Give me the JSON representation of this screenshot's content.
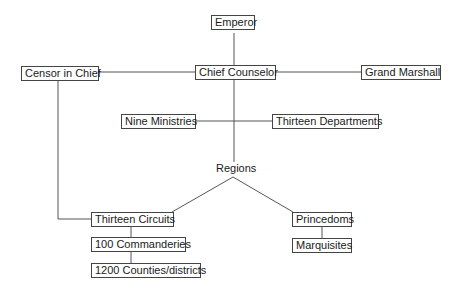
{
  "diagram": {
    "nodes": {
      "emperor": "Emperor",
      "chief_counselor": "Chief Counselor",
      "censor_in_chief": "Censor in Chief",
      "grand_marshall": "Grand Marshall",
      "nine_ministries": "Nine Ministries",
      "thirteen_departments": "Thirteen Departments",
      "regions": "Regions",
      "thirteen_circuits": "Thirteen Circuits",
      "commanderies": "100 Commanderies",
      "counties": "1200 Counties/districts",
      "princedoms": "Princedoms",
      "marquisites": "Marquisites"
    },
    "edges": [
      [
        "Emperor",
        "Chief Counselor"
      ],
      [
        "Chief Counselor",
        "Censor in Chief"
      ],
      [
        "Chief Counselor",
        "Grand Marshall"
      ],
      [
        "Chief Counselor",
        "Regions"
      ],
      [
        "Nine Ministries",
        "Thirteen Departments"
      ],
      [
        "Censor in Chief",
        "Thirteen Circuits"
      ],
      [
        "Regions",
        "Thirteen Circuits"
      ],
      [
        "Regions",
        "Princedoms"
      ],
      [
        "Thirteen Circuits",
        "100 Commanderies"
      ],
      [
        "100 Commanderies",
        "1200 Counties/districts"
      ],
      [
        "Princedoms",
        "Marquisites"
      ]
    ]
  }
}
